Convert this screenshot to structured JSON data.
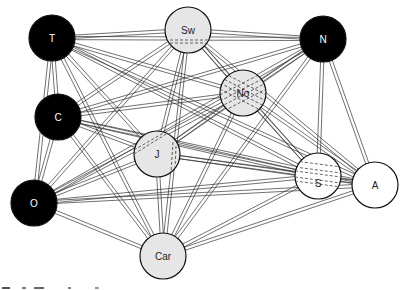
{
  "diagram": {
    "type": "complete-network-graph",
    "edge_style": "double-line",
    "colors": {
      "dark_node": "#000000",
      "light_node": "#e6e6e6",
      "white_node": "#ffffff",
      "edge": "#333333"
    },
    "nodes": [
      {
        "id": "T",
        "label": "T",
        "x": 52,
        "y": 38,
        "r": 23,
        "fill": "dark"
      },
      {
        "id": "Sw",
        "label": "Sw",
        "x": 188,
        "y": 30,
        "r": 23,
        "fill": "light",
        "dashes": "horizontal"
      },
      {
        "id": "N",
        "label": "N",
        "x": 323,
        "y": 39,
        "r": 23,
        "fill": "dark"
      },
      {
        "id": "No",
        "label": "No",
        "x": 243,
        "y": 93,
        "r": 23,
        "fill": "light",
        "dashes": "cross"
      },
      {
        "id": "C",
        "label": "C",
        "x": 58,
        "y": 117,
        "r": 23,
        "fill": "dark"
      },
      {
        "id": "J",
        "label": "J",
        "x": 157,
        "y": 154,
        "r": 23,
        "fill": "light",
        "dashes": "arc"
      },
      {
        "id": "S",
        "label": "S",
        "x": 318,
        "y": 176,
        "r": 23,
        "fill": "white",
        "dashes": "horizontal"
      },
      {
        "id": "A",
        "label": "A",
        "x": 375,
        "y": 185,
        "r": 23,
        "fill": "white"
      },
      {
        "id": "O",
        "label": "O",
        "x": 34,
        "y": 203,
        "r": 23,
        "fill": "dark"
      },
      {
        "id": "Car",
        "label": "Car",
        "x": 163,
        "y": 256,
        "r": 23,
        "fill": "light"
      }
    ]
  },
  "caption": {
    "visible": "partial-cropped"
  }
}
